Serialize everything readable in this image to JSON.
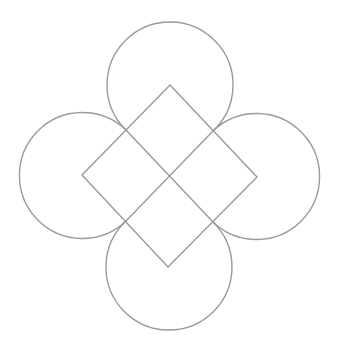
{
  "figure": {
    "width": 339,
    "height": 350,
    "background": "#ffffff",
    "stroke_color": "#9a9a9a"
  },
  "shapes": {
    "diamond": {
      "vertices": [
        [
          170,
          85
        ],
        [
          257,
          177
        ],
        [
          168,
          267
        ],
        [
          82,
          175
        ]
      ]
    },
    "inner_cross": [
      [
        [
          126,
          130
        ],
        [
          213,
          222
        ]
      ],
      [
        [
          213,
          131
        ],
        [
          126,
          221
        ]
      ]
    ],
    "arcs": [
      {
        "name": "top",
        "center": [
          169.5,
          83
        ],
        "r": 63,
        "from": [
          126,
          130
        ],
        "to": [
          213,
          131
        ]
      },
      {
        "name": "right",
        "center": [
          255,
          177
        ],
        "r": 63,
        "from": [
          213,
          131
        ],
        "to": [
          213,
          222
        ]
      },
      {
        "name": "bottom",
        "center": [
          168,
          269
        ],
        "r": 63,
        "from": [
          213,
          222
        ],
        "to": [
          126,
          221
        ]
      },
      {
        "name": "left",
        "center": [
          84,
          175
        ],
        "r": 63,
        "from": [
          126,
          221
        ],
        "to": [
          126,
          130
        ]
      }
    ]
  }
}
